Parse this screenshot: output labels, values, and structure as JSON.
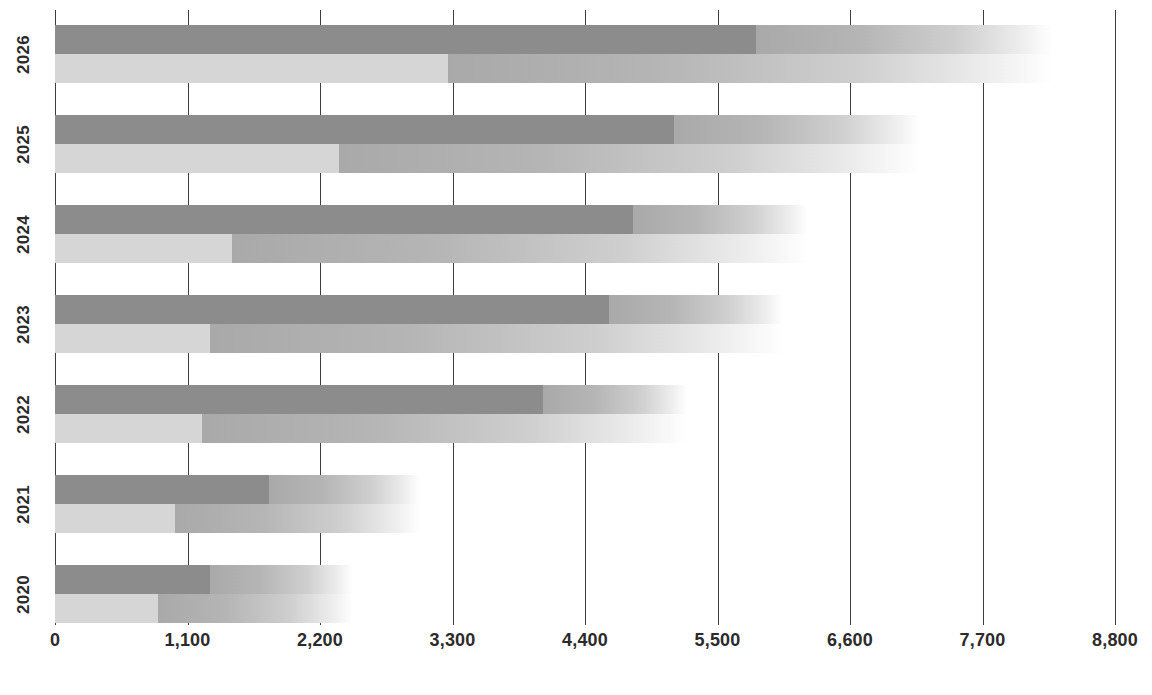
{
  "chart_data": {
    "type": "bar",
    "orientation": "horizontal",
    "title": "",
    "subtitle": "",
    "xlabel": "",
    "ylabel": "",
    "categories": [
      "2026",
      "2025",
      "2024",
      "2023",
      "2022",
      "2021",
      "2020"
    ],
    "xlim": [
      0,
      8800
    ],
    "grid": true,
    "gridlines_at": [
      0,
      1100,
      2200,
      3300,
      4400,
      5500,
      6600,
      7700,
      8800
    ],
    "xtick_labels": [
      "0",
      "1,100",
      "2,200",
      "3,300",
      "4,400",
      "5,500",
      "6,600",
      "7,700",
      "8,800"
    ],
    "xtick_values": [
      0,
      1100,
      2200,
      3300,
      4400,
      5500,
      6600,
      7700,
      8800
    ],
    "legend": [],
    "legend_position": "none",
    "series": [
      {
        "name": "upper-bar-solid",
        "style": "dark",
        "values": [
          5820,
          5140,
          4800,
          4600,
          4050,
          1780,
          1290
        ]
      },
      {
        "name": "lower-bar-solid",
        "style": "light",
        "values": [
          3260,
          2360,
          1470,
          1290,
          1220,
          1000,
          855
        ]
      },
      {
        "name": "upper-bar-fade-end",
        "style": "gradient",
        "values": [
          8280,
          7180,
          6250,
          6040,
          5250,
          3030,
          2470
        ]
      },
      {
        "name": "lower-bar-fade-end",
        "style": "gradient",
        "values": [
          8280,
          7180,
          6250,
          6040,
          5250,
          3030,
          2470
        ]
      }
    ],
    "colors": {
      "dark_bar": "#8c8c8c",
      "light_bar": "#d6d6d6",
      "fade_bar_start": "#a9a9a9",
      "fade_bar_end": "#ffffff",
      "gridline": "#3d3d3d",
      "text": "#2b2b2b",
      "background": "#ffffff"
    }
  },
  "layout": {
    "plot_left_px": 55,
    "plot_width_px": 1060,
    "row_pitch_px": 90,
    "row_top_px": 25,
    "bar_height_px": 29
  }
}
